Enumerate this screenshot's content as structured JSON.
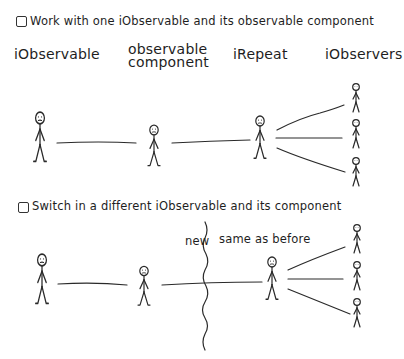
{
  "section1": {
    "heading": "Work with one iObservable and its observable component",
    "checked": false,
    "labels": {
      "observable": "iObservable",
      "component_line1": "observable",
      "component_line2": "component",
      "repeat": "iRepeat",
      "observers": "iObservers"
    }
  },
  "section2": {
    "heading": "Switch in a different iObservable and its component",
    "checked": false,
    "annotation_new": "new",
    "annotation_same": "same as before"
  },
  "colors": {
    "ink": "#2a2a2a",
    "background": "#ffffff"
  }
}
